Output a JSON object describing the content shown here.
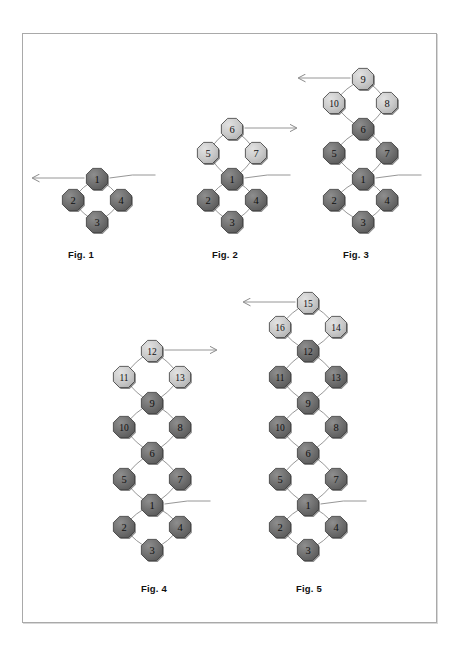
{
  "page": {
    "background_color": "#ffffff",
    "frame_border_color": "#a9a9a9",
    "width": 459,
    "height": 650
  },
  "style": {
    "node_fill_dark": "#6e6e6e",
    "node_fill_light": "#c8c8c8",
    "node_stroke": "#3a3a3a",
    "node_shadow": "#2f2f2f",
    "edge_color": "#8a8a8a",
    "label_color": "#111111",
    "node_radius": 11.5,
    "node_shape": "octagon"
  },
  "figures": [
    {
      "id": "fig1",
      "caption": "Fig. 1",
      "caption_x": 68,
      "caption_y": 249,
      "center_x": 97,
      "base_y": 196,
      "ring_gap": 46,
      "arrow": {
        "direction": "left",
        "from_node": 1,
        "length": 52
      },
      "rings": [
        {
          "top": 1,
          "left": 2,
          "right": 4,
          "bottom": 3,
          "tone": "dark"
        }
      ],
      "nodes": [
        {
          "label": "1",
          "x": 97,
          "y": 179,
          "tone": "dark"
        },
        {
          "label": "2",
          "x": 73,
          "y": 200,
          "tone": "dark"
        },
        {
          "label": "4",
          "x": 121,
          "y": 200,
          "tone": "dark"
        },
        {
          "label": "3",
          "x": 97,
          "y": 222,
          "tone": "dark"
        }
      ]
    },
    {
      "id": "fig2",
      "caption": "Fig. 2",
      "caption_x": 212,
      "caption_y": 249,
      "center_x": 232,
      "arrow": {
        "direction": "right",
        "from_node": 6,
        "length": 52
      },
      "nodes": [
        {
          "label": "6",
          "x": 232,
          "y": 129,
          "tone": "light"
        },
        {
          "label": "5",
          "x": 208,
          "y": 153,
          "tone": "light"
        },
        {
          "label": "7",
          "x": 256,
          "y": 153,
          "tone": "light"
        },
        {
          "label": "1",
          "x": 232,
          "y": 179,
          "tone": "dark"
        },
        {
          "label": "2",
          "x": 208,
          "y": 200,
          "tone": "dark"
        },
        {
          "label": "4",
          "x": 256,
          "y": 200,
          "tone": "dark"
        },
        {
          "label": "3",
          "x": 232,
          "y": 222,
          "tone": "dark"
        }
      ]
    },
    {
      "id": "fig3",
      "caption": "Fig. 3",
      "caption_x": 343,
      "caption_y": 249,
      "center_x": 363,
      "arrow": {
        "direction": "left",
        "from_node": 9,
        "length": 52
      },
      "nodes": [
        {
          "label": "9",
          "x": 363,
          "y": 79,
          "tone": "light"
        },
        {
          "label": "10",
          "x": 334,
          "y": 103,
          "tone": "light"
        },
        {
          "label": "8",
          "x": 387,
          "y": 103,
          "tone": "light"
        },
        {
          "label": "6",
          "x": 363,
          "y": 129,
          "tone": "dark"
        },
        {
          "label": "5",
          "x": 334,
          "y": 153,
          "tone": "dark"
        },
        {
          "label": "7",
          "x": 387,
          "y": 153,
          "tone": "dark"
        },
        {
          "label": "1",
          "x": 363,
          "y": 179,
          "tone": "dark"
        },
        {
          "label": "2",
          "x": 334,
          "y": 200,
          "tone": "dark"
        },
        {
          "label": "4",
          "x": 387,
          "y": 200,
          "tone": "dark"
        },
        {
          "label": "3",
          "x": 363,
          "y": 222,
          "tone": "dark"
        }
      ]
    },
    {
      "id": "fig4",
      "caption": "Fig. 4",
      "caption_x": 141,
      "caption_y": 583,
      "center_x": 152,
      "arrow": {
        "direction": "right",
        "from_node": 12,
        "length": 52
      },
      "nodes": [
        {
          "label": "12",
          "x": 152,
          "y": 351,
          "tone": "light"
        },
        {
          "label": "11",
          "x": 124,
          "y": 377,
          "tone": "light"
        },
        {
          "label": "13",
          "x": 180,
          "y": 377,
          "tone": "light"
        },
        {
          "label": "9",
          "x": 152,
          "y": 403,
          "tone": "dark"
        },
        {
          "label": "10",
          "x": 124,
          "y": 427,
          "tone": "dark"
        },
        {
          "label": "8",
          "x": 180,
          "y": 427,
          "tone": "dark"
        },
        {
          "label": "6",
          "x": 152,
          "y": 453,
          "tone": "dark"
        },
        {
          "label": "5",
          "x": 124,
          "y": 479,
          "tone": "dark"
        },
        {
          "label": "7",
          "x": 180,
          "y": 479,
          "tone": "dark"
        },
        {
          "label": "1",
          "x": 152,
          "y": 505,
          "tone": "dark"
        },
        {
          "label": "2",
          "x": 124,
          "y": 527,
          "tone": "dark"
        },
        {
          "label": "4",
          "x": 180,
          "y": 527,
          "tone": "dark"
        },
        {
          "label": "3",
          "x": 152,
          "y": 550,
          "tone": "dark"
        }
      ]
    },
    {
      "id": "fig5",
      "caption": "Fig. 5",
      "caption_x": 296,
      "caption_y": 583,
      "center_x": 308,
      "arrow": {
        "direction": "left",
        "from_node": 15,
        "length": 52
      },
      "nodes": [
        {
          "label": "15",
          "x": 308,
          "y": 303,
          "tone": "light"
        },
        {
          "label": "16",
          "x": 280,
          "y": 327,
          "tone": "light"
        },
        {
          "label": "14",
          "x": 336,
          "y": 327,
          "tone": "light"
        },
        {
          "label": "12",
          "x": 308,
          "y": 351,
          "tone": "dark"
        },
        {
          "label": "11",
          "x": 280,
          "y": 377,
          "tone": "dark"
        },
        {
          "label": "13",
          "x": 336,
          "y": 377,
          "tone": "dark"
        },
        {
          "label": "9",
          "x": 308,
          "y": 403,
          "tone": "dark"
        },
        {
          "label": "10",
          "x": 280,
          "y": 427,
          "tone": "dark"
        },
        {
          "label": "8",
          "x": 336,
          "y": 427,
          "tone": "dark"
        },
        {
          "label": "6",
          "x": 308,
          "y": 453,
          "tone": "dark"
        },
        {
          "label": "5",
          "x": 280,
          "y": 479,
          "tone": "dark"
        },
        {
          "label": "7",
          "x": 336,
          "y": 479,
          "tone": "dark"
        },
        {
          "label": "1",
          "x": 308,
          "y": 505,
          "tone": "dark"
        },
        {
          "label": "2",
          "x": 280,
          "y": 527,
          "tone": "dark"
        },
        {
          "label": "4",
          "x": 336,
          "y": 527,
          "tone": "dark"
        },
        {
          "label": "3",
          "x": 308,
          "y": 550,
          "tone": "dark"
        }
      ]
    }
  ]
}
